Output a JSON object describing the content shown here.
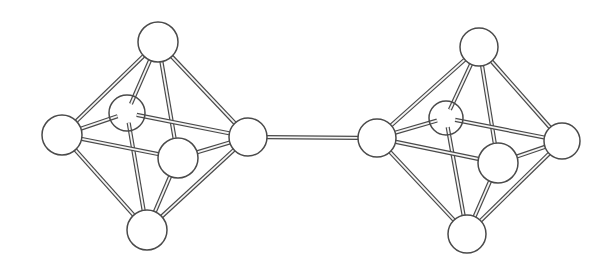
{
  "figure": {
    "colors": {
      "background": "#ffffff",
      "outline": "#4a4a4a",
      "atom_fill": "#ffffff",
      "bond_fill": "#f4f4f4"
    },
    "clusters": [
      {
        "name": "left-octahedron",
        "atoms": [
          {
            "id": "top",
            "x": 158,
            "y": 42,
            "r": 20,
            "layer": "front"
          },
          {
            "id": "back",
            "x": 127,
            "y": 113,
            "r": 18,
            "layer": "back"
          },
          {
            "id": "left",
            "x": 62,
            "y": 135,
            "r": 20,
            "layer": "front"
          },
          {
            "id": "front",
            "x": 178,
            "y": 158,
            "r": 20,
            "layer": "front"
          },
          {
            "id": "right",
            "x": 248,
            "y": 137,
            "r": 19,
            "layer": "front"
          },
          {
            "id": "bottom",
            "x": 147,
            "y": 230,
            "r": 20,
            "layer": "front"
          }
        ],
        "bonds": [
          [
            "top",
            "left"
          ],
          [
            "top",
            "right"
          ],
          [
            "top",
            "back"
          ],
          [
            "top",
            "front"
          ],
          [
            "bottom",
            "left"
          ],
          [
            "bottom",
            "right"
          ],
          [
            "bottom",
            "back"
          ],
          [
            "bottom",
            "front"
          ],
          [
            "left",
            "back"
          ],
          [
            "left",
            "front"
          ],
          [
            "right",
            "back"
          ],
          [
            "right",
            "front"
          ]
        ]
      },
      {
        "name": "right-octahedron",
        "atoms": [
          {
            "id": "top",
            "x": 479,
            "y": 47,
            "r": 19,
            "layer": "front"
          },
          {
            "id": "back",
            "x": 446,
            "y": 118,
            "r": 17,
            "layer": "back"
          },
          {
            "id": "left",
            "x": 377,
            "y": 138,
            "r": 19,
            "layer": "front"
          },
          {
            "id": "front",
            "x": 498,
            "y": 163,
            "r": 20,
            "layer": "front"
          },
          {
            "id": "right",
            "x": 562,
            "y": 141,
            "r": 18,
            "layer": "front"
          },
          {
            "id": "bottom",
            "x": 467,
            "y": 234,
            "r": 19,
            "layer": "front"
          }
        ],
        "bonds": [
          [
            "top",
            "left"
          ],
          [
            "top",
            "right"
          ],
          [
            "top",
            "back"
          ],
          [
            "top",
            "front"
          ],
          [
            "bottom",
            "left"
          ],
          [
            "bottom",
            "right"
          ],
          [
            "bottom",
            "back"
          ],
          [
            "bottom",
            "front"
          ],
          [
            "left",
            "back"
          ],
          [
            "left",
            "front"
          ],
          [
            "right",
            "back"
          ],
          [
            "right",
            "front"
          ]
        ]
      }
    ],
    "bridge": {
      "from": {
        "cluster": 0,
        "atom": "right"
      },
      "to": {
        "cluster": 1,
        "atom": "left"
      }
    }
  }
}
